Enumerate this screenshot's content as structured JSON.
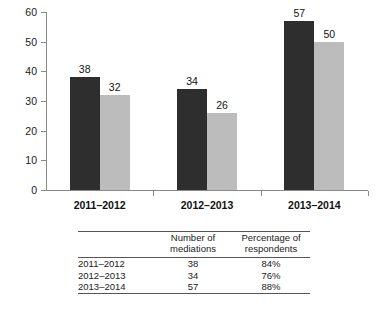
{
  "chart_data": {
    "type": "bar",
    "title": "",
    "xlabel": "",
    "ylabel": "",
    "ylim": [
      0,
      60
    ],
    "yticks": [
      0,
      10,
      20,
      30,
      40,
      50,
      60
    ],
    "grid": false,
    "legend": "none",
    "categories": [
      "2011–2012",
      "2012–2013",
      "2013–2014"
    ],
    "series": [
      {
        "name": "Number of mediations",
        "color": "#2e2e2e",
        "values": [
          38,
          34,
          57
        ]
      },
      {
        "name": "Percentage of respondents",
        "color": "#bcbcbc",
        "values": [
          32,
          26,
          50
        ]
      }
    ],
    "bar_labels": {
      "dark": [
        "38",
        "34",
        "57"
      ],
      "light": [
        "32",
        "26",
        "50"
      ]
    },
    "ytick_labels": [
      "0",
      "10",
      "20",
      "30",
      "40",
      "50",
      "60"
    ]
  },
  "table": {
    "headers": {
      "corner": "",
      "col1_line1": "Number of",
      "col1_line2": "mediations",
      "col2_line1": "Percentage of",
      "col2_line2": "respondents"
    },
    "rows": [
      {
        "year": "2011–2012",
        "mediations": "38",
        "percentage": "84%"
      },
      {
        "year": "2012–2013",
        "mediations": "34",
        "percentage": "76%"
      },
      {
        "year": "2013–2014",
        "mediations": "57",
        "percentage": "88%"
      }
    ]
  },
  "colors": {
    "dark_bar": "#2e2e2e",
    "light_bar": "#bcbcbc",
    "axis": "#8a8a8a",
    "rule": "#555555",
    "background": "#ffffff"
  }
}
